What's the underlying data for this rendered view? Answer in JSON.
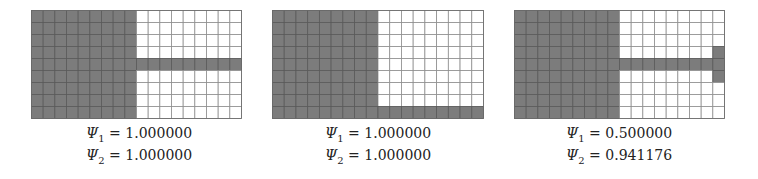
{
  "grid": {
    "rows": 9,
    "cols": 18,
    "colors": {
      "filled": "#7c7c7c",
      "empty": "#ffffff",
      "line_on_filled": "#5a5a5a",
      "line_on_empty": "#8f8f8f"
    }
  },
  "panels": [
    {
      "id": "panel-1",
      "filled_cells_rule": "left half (cols 0-8) plus row 4 across all columns",
      "filled": {
        "rect_blocks": [
          {
            "row_start": 0,
            "row_end": 8,
            "col_start": 0,
            "col_end": 8
          },
          {
            "row_start": 4,
            "row_end": 4,
            "col_start": 9,
            "col_end": 17
          }
        ]
      },
      "labels": [
        {
          "symbol": "Ψ",
          "sub": "1",
          "eq": " = ",
          "value": "1.000000"
        },
        {
          "symbol": "Ψ",
          "sub": "2",
          "eq": " = ",
          "value": "1.000000"
        }
      ]
    },
    {
      "id": "panel-2",
      "filled_cells_rule": "left half (cols 0-8) plus bottom row across all columns",
      "filled": {
        "rect_blocks": [
          {
            "row_start": 0,
            "row_end": 8,
            "col_start": 0,
            "col_end": 8
          },
          {
            "row_start": 8,
            "row_end": 8,
            "col_start": 9,
            "col_end": 17
          }
        ]
      },
      "labels": [
        {
          "symbol": "Ψ",
          "sub": "1",
          "eq": " = ",
          "value": "1.000000"
        },
        {
          "symbol": "Ψ",
          "sub": "2",
          "eq": " = ",
          "value": "1.000000"
        }
      ]
    },
    {
      "id": "panel-3",
      "filled_cells_rule": "left half (cols 0-8), row 4 across, plus last column rows 3-5",
      "filled": {
        "rect_blocks": [
          {
            "row_start": 0,
            "row_end": 8,
            "col_start": 0,
            "col_end": 8
          },
          {
            "row_start": 4,
            "row_end": 4,
            "col_start": 9,
            "col_end": 17
          },
          {
            "row_start": 3,
            "row_end": 5,
            "col_start": 17,
            "col_end": 17
          }
        ]
      },
      "labels": [
        {
          "symbol": "Ψ",
          "sub": "1",
          "eq": " = ",
          "value": "0.500000"
        },
        {
          "symbol": "Ψ",
          "sub": "2",
          "eq": " = ",
          "value": "0.941176"
        }
      ]
    }
  ]
}
